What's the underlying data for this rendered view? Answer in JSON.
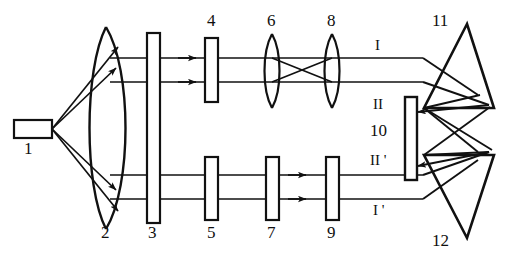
{
  "figure": {
    "type": "ray-diagram",
    "width": 505,
    "height": 257,
    "background_color": "#ffffff",
    "line_color": "#111111"
  },
  "components": [
    {
      "id": "1",
      "label": "1",
      "name": "light-source",
      "shape": "small-rectangle",
      "x": 30,
      "y": 128,
      "label_x": 24,
      "label_y": 148
    },
    {
      "id": "2",
      "label": "2",
      "name": "condenser-lens",
      "shape": "biconvex-lens",
      "x": 108,
      "y": 128,
      "label_x": 101,
      "label_y": 232
    },
    {
      "id": "3",
      "label": "3",
      "name": "tall-plate",
      "shape": "tall-rectangle",
      "x": 153,
      "y": 128,
      "label_x": 148,
      "label_y": 232
    },
    {
      "id": "4",
      "label": "4",
      "name": "upper-plate-4",
      "shape": "small-rectangle",
      "x": 212,
      "y": 70,
      "label_x": 207,
      "label_y": 24
    },
    {
      "id": "5",
      "label": "5",
      "name": "lower-plate-5",
      "shape": "small-rectangle",
      "x": 212,
      "y": 187,
      "label_x": 207,
      "label_y": 232
    },
    {
      "id": "6",
      "label": "6",
      "name": "upper-lens-6",
      "shape": "thin-lens",
      "x": 272,
      "y": 70,
      "label_x": 267,
      "label_y": 24
    },
    {
      "id": "7",
      "label": "7",
      "name": "lower-plate-7",
      "shape": "small-rectangle",
      "x": 272,
      "y": 187,
      "label_x": 267,
      "label_y": 232
    },
    {
      "id": "8",
      "label": "8",
      "name": "upper-lens-8",
      "shape": "thin-lens",
      "x": 332,
      "y": 70,
      "label_x": 327,
      "label_y": 24
    },
    {
      "id": "9",
      "label": "9",
      "name": "lower-plate-9",
      "shape": "small-rectangle",
      "x": 332,
      "y": 187,
      "label_x": 327,
      "label_y": 232
    },
    {
      "id": "10",
      "label": "10",
      "name": "detector-screen",
      "shape": "vertical-bar",
      "x": 411,
      "y": 135,
      "label_x": 374,
      "label_y": 129
    },
    {
      "id": "11",
      "label": "11",
      "name": "upper-prism",
      "shape": "triangular-prism",
      "x": 460,
      "y": 72,
      "label_x": 435,
      "label_y": 24
    },
    {
      "id": "12",
      "label": "12",
      "name": "lower-prism",
      "shape": "triangular-prism",
      "x": 460,
      "y": 190,
      "label_x": 435,
      "label_y": 238
    }
  ],
  "beam_labels": [
    {
      "id": "I",
      "label": "I",
      "name": "beam-label-I",
      "x": 375,
      "y": 46
    },
    {
      "id": "II",
      "label": "II",
      "name": "beam-label-II",
      "x": 373,
      "y": 104
    },
    {
      "id": "IIp",
      "label": "II '",
      "name": "beam-label-II-prime",
      "x": 370,
      "y": 160
    },
    {
      "id": "Ip",
      "label": "I '",
      "name": "beam-label-I-prime",
      "x": 373,
      "y": 210
    }
  ],
  "beam_paths": {
    "upper_rays_y": [
      58,
      82
    ],
    "lower_rays_y": [
      175,
      199
    ],
    "source_x": 52,
    "crossover_x": 302,
    "crossover_y": 70
  }
}
